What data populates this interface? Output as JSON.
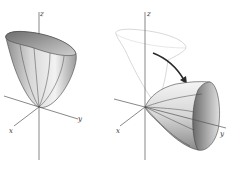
{
  "figures": [
    {
      "id": "left",
      "description": "Paraboloid opening upward along z-axis",
      "axes": {
        "x": "x",
        "y": "y",
        "z": "z"
      },
      "surface": {
        "type": "paraboloid",
        "opens_along": "z",
        "fill_light": "#e6e6e6",
        "fill_dark": "#8a8a8a"
      }
    },
    {
      "id": "right",
      "description": "Original paraboloid outline rotated to open along y-axis",
      "axes": {
        "x": "x",
        "y": "y",
        "z": "z"
      },
      "ghost_surface": {
        "type": "paraboloid",
        "opens_along": "z",
        "stroke": "#bbbbbb"
      },
      "surface": {
        "type": "paraboloid",
        "opens_along": "y",
        "fill_light": "#e6e6e6",
        "fill_dark": "#8a8a8a"
      },
      "arrow": {
        "from": "ghost_surface",
        "to": "surface",
        "color": "#333333"
      }
    }
  ]
}
